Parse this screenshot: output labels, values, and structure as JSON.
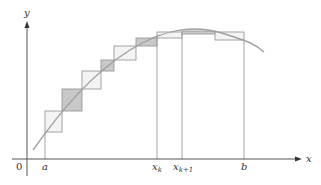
{
  "diagram": {
    "type": "upper-lower-riemann-sums",
    "axes": {
      "x_label": "x",
      "y_label": "y",
      "origin_label": "0"
    },
    "tick_labels": {
      "a": "a",
      "xk": "x",
      "xk_sub": "k",
      "xk1": "x",
      "xk1_sub": "k+1",
      "b": "b"
    },
    "colors": {
      "axis": "#555555",
      "curve": "#a0a0a0",
      "rect_stroke": "#9a9a9a",
      "shaded_fill": "#c8c8c8",
      "unshaded_fill": "#f4f4f4"
    },
    "rectangles": [
      {
        "x0": 45,
        "x1": 62,
        "y_top": 111,
        "y_bot": 132,
        "shaded": false
      },
      {
        "x0": 62,
        "x1": 82,
        "y_top": 89,
        "y_bot": 111,
        "shaded": true
      },
      {
        "x0": 82,
        "x1": 101,
        "y_top": 71,
        "y_bot": 89,
        "shaded": false
      },
      {
        "x0": 101,
        "x1": 114,
        "y_top": 60,
        "y_bot": 71,
        "shaded": true
      },
      {
        "x0": 114,
        "x1": 136,
        "y_top": 46,
        "y_bot": 60,
        "shaded": false
      },
      {
        "x0": 136,
        "x1": 157,
        "y_top": 38,
        "y_bot": 46,
        "shaded": true
      },
      {
        "x0": 157,
        "x1": 182,
        "y_top": 32,
        "y_bot": 38,
        "shaded": false
      },
      {
        "x0": 182,
        "x1": 215,
        "y_top": 31,
        "y_bot": 34,
        "shaded": true
      },
      {
        "x0": 215,
        "x1": 244,
        "y_top": 32,
        "y_bot": 40,
        "shaded": false
      }
    ]
  }
}
